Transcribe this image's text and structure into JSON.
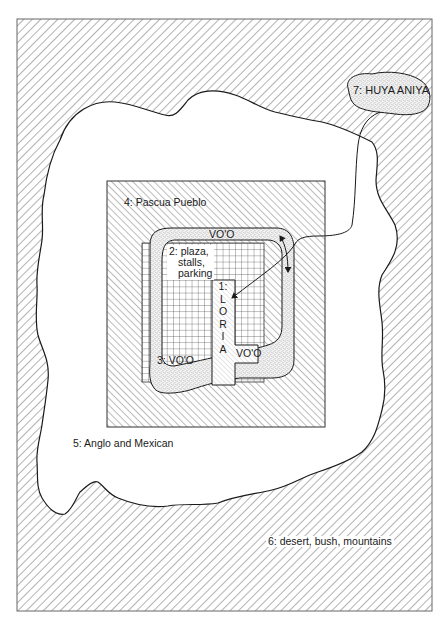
{
  "figure": {
    "type": "concentric zone map",
    "colors": {
      "line": "#1a1a1a",
      "hatch": "#555555",
      "stipple": "#8a8a8a",
      "background": "#ffffff"
    }
  },
  "zones": [
    {
      "id": 1,
      "label": "1: LORIA",
      "number": "1:",
      "letters": [
        "L",
        "O",
        "R",
        "I",
        "A"
      ],
      "pattern": "fine diagonal hatch"
    },
    {
      "id": 2,
      "label": "2: plaza, stalls, parking",
      "lines": [
        "2: plaza,",
        "stalls,",
        "parking"
      ],
      "pattern": "grid"
    },
    {
      "id": 3,
      "label": "3: VO'O",
      "pattern": "stipple path"
    },
    {
      "id": 4,
      "label": "4: Pascua Pueblo",
      "pattern": "diagonal hatch (/)"
    },
    {
      "id": 5,
      "label": "5: Anglo and Mexican",
      "pattern": "blank"
    },
    {
      "id": 6,
      "label": "6: desert, bush, mountains",
      "pattern": "diagonal hatch (\\)"
    },
    {
      "id": 7,
      "label": "7: HUYA ANIYA",
      "pattern": "stipple"
    }
  ],
  "path_labels": {
    "top": "VO'O",
    "inner": "VO'O"
  }
}
